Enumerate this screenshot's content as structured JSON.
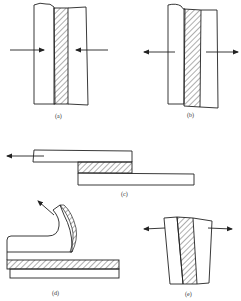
{
  "figure": {
    "panels": [
      {
        "id": "a",
        "label": "(a)",
        "mode": "compression",
        "arrows": "inward"
      },
      {
        "id": "b",
        "label": "(b)",
        "mode": "tension",
        "arrows": "outward"
      },
      {
        "id": "c",
        "label": "(c)",
        "mode": "shear",
        "arrows": "left"
      },
      {
        "id": "d",
        "label": "(d)",
        "mode": "peel",
        "arrows": "up-left"
      },
      {
        "id": "e",
        "label": "(e)",
        "mode": "cleavage",
        "arrows": "outward"
      }
    ],
    "colors": {
      "line": "#222222",
      "hatch": "#333333",
      "background": "#ffffff"
    }
  }
}
